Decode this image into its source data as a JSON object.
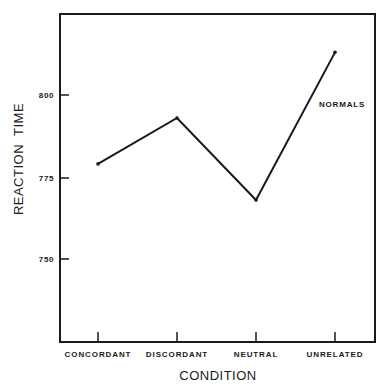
{
  "chart_data": {
    "type": "line",
    "title": "",
    "xlabel": "CONDITION",
    "ylabel": "REACTION  TIME",
    "categories": [
      "CONCORDANT",
      "DISCORDANT",
      "NEUTRAL",
      "UNRELATED"
    ],
    "series": [
      {
        "name": "NORMALS",
        "values": [
          779,
          793,
          768,
          813
        ]
      }
    ],
    "yticks": [
      750,
      775,
      800
    ],
    "ytick_labels": [
      "750",
      "775",
      "800"
    ],
    "ylim": [
      725,
      824
    ],
    "grid": false,
    "legend_position": "inline label near series end (upper right)",
    "annotations": [
      "NORMALS"
    ]
  },
  "colors": {
    "line": "#1a1a1a",
    "frame": "#1a1a1a",
    "background": "#ffffff"
  }
}
